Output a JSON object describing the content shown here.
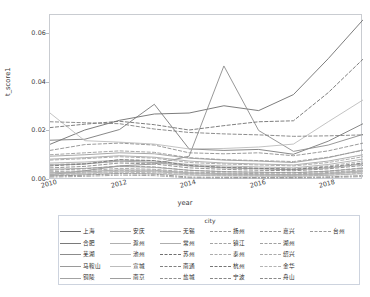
{
  "chart_data": {
    "type": "line",
    "title": "",
    "xlabel": "year",
    "ylabel": "t_score1",
    "xlim": [
      2010,
      2019
    ],
    "ylim": [
      0.0,
      0.068
    ],
    "grid": false,
    "legend_position": "bottom",
    "legend_title": "city",
    "xticks": [
      "2010",
      "2012",
      "2014",
      "2016",
      "2018"
    ],
    "xtick_values": [
      2010,
      2012,
      2014,
      2016,
      2018
    ],
    "yticks": [
      "0.00",
      "0.02",
      "0.04",
      "0.06"
    ],
    "ytick_values": [
      0.0,
      0.02,
      0.04,
      0.06
    ],
    "x": [
      2010,
      2011,
      2012,
      2013,
      2014,
      2015,
      2016,
      2017,
      2018,
      2019
    ],
    "series": [
      {
        "name": "上海",
        "style": "solid",
        "color": "#6e6e6e",
        "values": [
          0.0147,
          0.0206,
          0.0246,
          0.0272,
          0.0276,
          0.0306,
          0.0286,
          0.0352,
          0.05,
          0.066
        ]
      },
      {
        "name": "合肥",
        "style": "solid",
        "color": "#7a7a7a",
        "values": [
          0.0164,
          0.0168,
          0.0208,
          0.0312,
          0.0128,
          0.0122,
          0.0126,
          0.0106,
          0.016,
          0.0232
        ]
      },
      {
        "name": "芜湖",
        "style": "solid",
        "color": "#8c8c8c",
        "values": [
          0.0022,
          0.0038,
          0.0058,
          0.0066,
          0.0098,
          0.047,
          0.0204,
          0.0118,
          0.0144,
          0.0188
        ]
      },
      {
        "name": "马鞍山",
        "style": "solid",
        "color": "#9a9a9a",
        "values": [
          0.0062,
          0.0066,
          0.0078,
          0.0072,
          0.0058,
          0.005,
          0.0046,
          0.0042,
          0.005,
          0.0066
        ]
      },
      {
        "name": "铜陵",
        "style": "solid",
        "color": "#a3a3a3",
        "values": [
          0.0044,
          0.0048,
          0.0056,
          0.0052,
          0.004,
          0.0034,
          0.0032,
          0.003,
          0.0036,
          0.0048
        ]
      },
      {
        "name": "安庆",
        "style": "solid",
        "color": "#a9a9a9",
        "values": [
          0.003,
          0.0034,
          0.0042,
          0.004,
          0.003,
          0.0026,
          0.0024,
          0.0022,
          0.0028,
          0.0038
        ]
      },
      {
        "name": "滁州",
        "style": "solid",
        "color": "#b0b0b0",
        "values": [
          0.0024,
          0.0028,
          0.0036,
          0.0034,
          0.0026,
          0.0022,
          0.002,
          0.0019,
          0.0024,
          0.0033
        ]
      },
      {
        "name": "池州",
        "style": "solid",
        "color": "#b6b6b6",
        "values": [
          0.0018,
          0.0022,
          0.0028,
          0.0026,
          0.002,
          0.0017,
          0.0016,
          0.0015,
          0.0019,
          0.0026
        ]
      },
      {
        "name": "宣城",
        "style": "solid",
        "color": "#bcbcbc",
        "values": [
          0.0276,
          0.0162,
          0.0156,
          0.0148,
          0.0128,
          0.013,
          0.0136,
          0.0148,
          0.024,
          0.033
        ]
      },
      {
        "name": "南京",
        "style": "solid",
        "color": "#9e9e9e",
        "values": [
          0.0098,
          0.0104,
          0.0112,
          0.0108,
          0.009,
          0.0082,
          0.0078,
          0.0072,
          0.0092,
          0.0124
        ]
      },
      {
        "name": "无锡",
        "style": "solid",
        "color": "#a6a6a6",
        "values": [
          0.0086,
          0.0092,
          0.01,
          0.0094,
          0.0078,
          0.007,
          0.0066,
          0.0062,
          0.0078,
          0.0104
        ]
      },
      {
        "name": "常州",
        "style": "solid",
        "color": "#aeaeae",
        "values": [
          0.007,
          0.0074,
          0.0082,
          0.0078,
          0.0064,
          0.0058,
          0.0054,
          0.005,
          0.0064,
          0.0086
        ]
      },
      {
        "name": "苏州",
        "style": "dashed",
        "color": "#707070",
        "values": [
          0.0216,
          0.023,
          0.0242,
          0.0228,
          0.0206,
          0.0224,
          0.024,
          0.0244,
          0.036,
          0.0498
        ]
      },
      {
        "name": "南通",
        "style": "dashed",
        "color": "#808080",
        "values": [
          0.024,
          0.0236,
          0.0232,
          0.021,
          0.0196,
          0.019,
          0.0186,
          0.018,
          0.0182,
          0.0186
        ]
      },
      {
        "name": "盐城",
        "style": "dashed",
        "color": "#8f8f8f",
        "values": [
          0.0122,
          0.0146,
          0.0152,
          0.0144,
          0.0112,
          0.0108,
          0.0112,
          0.01,
          0.012,
          0.0152
        ]
      },
      {
        "name": "扬州",
        "style": "dashed",
        "color": "#9b9b9b",
        "values": [
          0.0104,
          0.0112,
          0.012,
          0.0114,
          0.0092,
          0.0084,
          0.008,
          0.0076,
          0.0094,
          0.0122
        ]
      },
      {
        "name": "镇江",
        "style": "dashed",
        "color": "#a4a4a4",
        "values": [
          0.0082,
          0.0088,
          0.0096,
          0.009,
          0.0072,
          0.0066,
          0.0062,
          0.0058,
          0.0072,
          0.0096
        ]
      },
      {
        "name": "泰州",
        "style": "dashed",
        "color": "#acacac",
        "values": [
          0.0064,
          0.0068,
          0.0076,
          0.0072,
          0.0058,
          0.0052,
          0.0048,
          0.0046,
          0.0058,
          0.0078
        ]
      },
      {
        "name": "杭州",
        "style": "dashed",
        "color": "#767676",
        "values": [
          0.0058,
          0.0066,
          0.0084,
          0.008,
          0.006,
          0.0052,
          0.0048,
          0.0044,
          0.0054,
          0.007
        ]
      },
      {
        "name": "宁波",
        "style": "dashed",
        "color": "#878787",
        "values": [
          0.005,
          0.0056,
          0.007,
          0.0066,
          0.005,
          0.0044,
          0.004,
          0.0038,
          0.0046,
          0.006
        ]
      },
      {
        "name": "嘉兴",
        "style": "dashed",
        "color": "#979797",
        "values": [
          0.004,
          0.0046,
          0.0058,
          0.0054,
          0.004,
          0.0035,
          0.0032,
          0.003,
          0.0037,
          0.005
        ]
      },
      {
        "name": "湖州",
        "style": "dashed",
        "color": "#a1a1a1",
        "values": [
          0.0034,
          0.0038,
          0.0048,
          0.0044,
          0.0033,
          0.0029,
          0.0026,
          0.0025,
          0.0031,
          0.0042
        ]
      },
      {
        "name": "绍兴",
        "style": "dashed",
        "color": "#ababab",
        "values": [
          0.0028,
          0.0032,
          0.004,
          0.0037,
          0.0028,
          0.0024,
          0.0022,
          0.0021,
          0.0026,
          0.0035
        ]
      },
      {
        "name": "金华",
        "style": "dashed",
        "color": "#b3b3b3",
        "values": [
          0.0021,
          0.0025,
          0.0032,
          0.003,
          0.0022,
          0.0019,
          0.0017,
          0.0016,
          0.002,
          0.0028
        ]
      },
      {
        "name": "舟山",
        "style": "dashdot",
        "color": "#8a8a8a",
        "values": [
          0.0016,
          0.002,
          0.0026,
          0.0024,
          0.0012,
          0.0011,
          0.001,
          0.001,
          0.0013,
          0.0018
        ]
      },
      {
        "name": "台州",
        "style": "dashdot",
        "color": "#9c9c9c",
        "values": [
          0.0012,
          0.0015,
          0.002,
          0.0018,
          0.0009,
          0.0008,
          0.0008,
          0.0008,
          0.001,
          0.0014
        ]
      }
    ]
  },
  "legend": {
    "title": "city"
  },
  "axes": {
    "xlabel": "year",
    "ylabel": "t_score1"
  }
}
